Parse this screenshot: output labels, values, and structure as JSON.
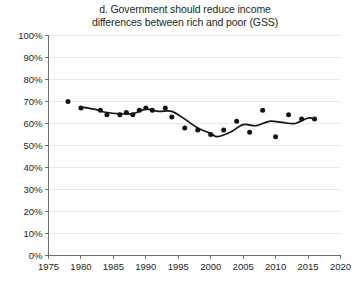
{
  "chart_data": {
    "type": "scatter",
    "title": "d. Government should reduce income differences between rich and poor (GSS)",
    "title_line1": "d. Government should reduce income",
    "title_line2": "differences between rich and poor (GSS)",
    "xlabel": "",
    "ylabel": "",
    "xlim": [
      1975,
      2020
    ],
    "ylim": [
      0,
      100
    ],
    "grid": true,
    "legend": false,
    "y_unit": "%",
    "xticks": [
      1975,
      1980,
      1985,
      1990,
      1995,
      2000,
      2005,
      2010,
      2015,
      2020
    ],
    "xtick_labels": [
      "1975",
      "1980",
      "1985",
      "1990",
      "1995",
      "2000",
      "2005",
      "2010",
      "2015",
      "2020"
    ],
    "yticks": [
      0,
      10,
      20,
      30,
      40,
      50,
      60,
      70,
      80,
      90,
      100
    ],
    "ytick_labels": [
      "0%",
      "10%",
      "20%",
      "30%",
      "40%",
      "50%",
      "60%",
      "70%",
      "80%",
      "90%",
      "100%"
    ],
    "series": [
      {
        "name": "GSS survey points",
        "type": "scatter",
        "marker": "circle",
        "color": "#141414",
        "points": [
          {
            "x": 1978,
            "y": 70
          },
          {
            "x": 1980,
            "y": 67
          },
          {
            "x": 1983,
            "y": 66
          },
          {
            "x": 1984,
            "y": 64
          },
          {
            "x": 1986,
            "y": 64
          },
          {
            "x": 1987,
            "y": 65
          },
          {
            "x": 1988,
            "y": 64
          },
          {
            "x": 1989,
            "y": 66
          },
          {
            "x": 1990,
            "y": 67
          },
          {
            "x": 1991,
            "y": 66
          },
          {
            "x": 1993,
            "y": 67
          },
          {
            "x": 1994,
            "y": 63
          },
          {
            "x": 1996,
            "y": 58
          },
          {
            "x": 1998,
            "y": 57
          },
          {
            "x": 2000,
            "y": 55
          },
          {
            "x": 2002,
            "y": 57
          },
          {
            "x": 2004,
            "y": 61
          },
          {
            "x": 2006,
            "y": 56
          },
          {
            "x": 2008,
            "y": 66
          },
          {
            "x": 2010,
            "y": 54
          },
          {
            "x": 2012,
            "y": 64
          },
          {
            "x": 2014,
            "y": 62
          },
          {
            "x": 2016,
            "y": 62
          }
        ]
      },
      {
        "name": "Smoothed trend",
        "type": "line",
        "color": "#141414",
        "points": [
          {
            "x": 1980,
            "y": 67.5
          },
          {
            "x": 1982,
            "y": 66.5
          },
          {
            "x": 1984,
            "y": 65
          },
          {
            "x": 1986,
            "y": 64.5
          },
          {
            "x": 1988,
            "y": 64.5
          },
          {
            "x": 1990,
            "y": 66.5
          },
          {
            "x": 1992,
            "y": 65.5
          },
          {
            "x": 1994,
            "y": 65.5
          },
          {
            "x": 1996,
            "y": 62
          },
          {
            "x": 1998,
            "y": 58
          },
          {
            "x": 2000,
            "y": 55.5
          },
          {
            "x": 2001,
            "y": 54
          },
          {
            "x": 2003,
            "y": 56
          },
          {
            "x": 2005,
            "y": 59.5
          },
          {
            "x": 2007,
            "y": 59
          },
          {
            "x": 2009,
            "y": 61
          },
          {
            "x": 2011,
            "y": 60.5
          },
          {
            "x": 2013,
            "y": 60
          },
          {
            "x": 2015,
            "y": 62.5
          },
          {
            "x": 2016,
            "y": 62
          }
        ]
      }
    ]
  }
}
